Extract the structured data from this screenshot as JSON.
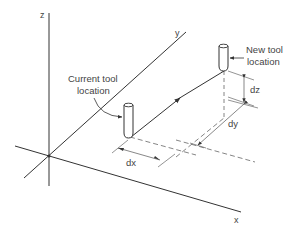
{
  "diagram": {
    "type": "3d-coordinate-tool-move",
    "axes": {
      "x_label": "x",
      "y_label": "y",
      "z_label": "z"
    },
    "current_tool": {
      "label_line1": "Current tool",
      "label_line2": "location"
    },
    "new_tool": {
      "label_line1": "New tool",
      "label_line2": "location"
    },
    "dimensions": {
      "dx": "dx",
      "dy": "dy",
      "dz": "dz"
    },
    "colors": {
      "line": "#333333",
      "dim": "#666666",
      "text": "#444444"
    }
  }
}
